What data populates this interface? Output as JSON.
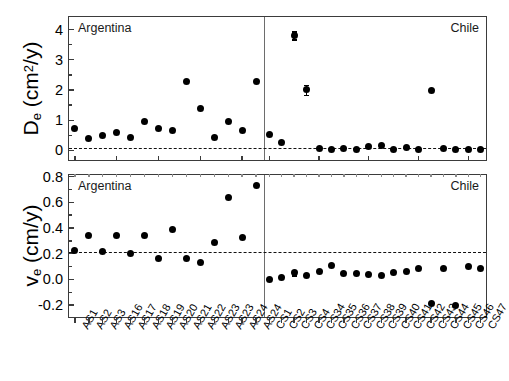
{
  "figure": {
    "panels": [
      {
        "id": "top",
        "ylabel_main": "D",
        "ylabel_sub": "e",
        "ylabel_unit_open": " (cm",
        "ylabel_unit_sup": "2",
        "ylabel_unit_close": "/y)",
        "left_caption": "Argentina",
        "right_caption": "Chile",
        "ytick_labels": [
          "0",
          "1",
          "2",
          "3",
          "4"
        ]
      },
      {
        "id": "bottom",
        "ylabel_main": "v",
        "ylabel_sub": "e",
        "ylabel_unit_open": " (cm",
        "ylabel_unit_sup": "",
        "ylabel_unit_close": "/y)",
        "left_caption": "Argentina",
        "right_caption": "Chile",
        "ytick_labels": [
          "-0.2",
          "0.0",
          "0.2",
          "0.4",
          "0.6",
          "0.8"
        ]
      }
    ]
  },
  "chart_data": [
    {
      "type": "scatter",
      "panel": "top",
      "title": "",
      "xlabel": "",
      "ylabel": "D_e (cm^2/y)",
      "ylim": [
        -0.35,
        4.45
      ],
      "yticks": [
        0,
        1,
        2,
        3,
        4
      ],
      "yticks_minor": [
        0.5,
        1.5,
        2.5,
        3.5
      ],
      "grid": false,
      "legend": "none",
      "reference_line": 0.12,
      "groups": [
        {
          "name": "Argentina",
          "categories": [
            "AS1",
            "AS2",
            "AS3",
            "AS16",
            "AS17",
            "AS18",
            "AS19",
            "AS20",
            "AS21",
            "AS22",
            "AS23",
            "AS23",
            "AS24",
            "AS24"
          ],
          "values": [
            0.72,
            0.38,
            0.48,
            0.6,
            0.42,
            0.96,
            0.73,
            0.67,
            2.27,
            1.38,
            0.42,
            0.96,
            0.67,
            2.27
          ],
          "errors": [
            0,
            0,
            0,
            0,
            0,
            0,
            0,
            0,
            0,
            0,
            0,
            0,
            0,
            0
          ]
        },
        {
          "name": "Chile",
          "categories": [
            "CS1",
            "CS2",
            "CS3",
            "CS4",
            "CS34",
            "CS35",
            "CS36",
            "CS37",
            "CS38",
            "CS39",
            "CS40",
            "CS41",
            "CS42",
            "CS43",
            "CS44",
            "CS45",
            "CS46",
            "CS47"
          ],
          "values": [
            0.53,
            0.25,
            3.81,
            2.01,
            0.05,
            0.03,
            0.06,
            0.04,
            0.13,
            0.16,
            0.04,
            0.1,
            0.04,
            1.98,
            0.05,
            0.03,
            0.04,
            0.03
          ],
          "errors": [
            0,
            0,
            0.13,
            0.16,
            0,
            0,
            0,
            0,
            0,
            0,
            0,
            0,
            0,
            0,
            0,
            0,
            0,
            0
          ]
        }
      ]
    },
    {
      "type": "scatter",
      "panel": "bottom",
      "title": "",
      "xlabel": "",
      "ylabel": "v_e (cm/y)",
      "ylim": [
        -0.3,
        0.82
      ],
      "yticks": [
        -0.2,
        0.0,
        0.2,
        0.4,
        0.6,
        0.8
      ],
      "yticks_minor": [
        -0.1,
        0.1,
        0.3,
        0.5,
        0.7
      ],
      "grid": false,
      "legend": "none",
      "reference_line": 0.219,
      "groups": [
        {
          "name": "Argentina",
          "categories": [
            "AS1",
            "AS2",
            "AS3",
            "AS16",
            "AS17",
            "AS18",
            "AS19",
            "AS20",
            "AS21",
            "AS22",
            "AS23",
            "AS23",
            "AS24",
            "AS24"
          ],
          "values": [
            0.222,
            0.34,
            0.216,
            0.34,
            0.202,
            0.34,
            0.16,
            0.39,
            0.16,
            0.132,
            0.288,
            0.64,
            0.33,
            0.733
          ],
          "errors": [
            0,
            0,
            0,
            0,
            0,
            0,
            0,
            0,
            0,
            0,
            0,
            0,
            0,
            0
          ]
        },
        {
          "name": "Chile",
          "categories": [
            "CS1",
            "CS2",
            "CS3",
            "CS4",
            "CS34",
            "CS35",
            "CS36",
            "CS37",
            "CS38",
            "CS39",
            "CS40",
            "CS41",
            "CS42",
            "CS43",
            "CS44",
            "CS45",
            "CS46",
            "CS47"
          ],
          "values": [
            0.002,
            0.012,
            0.055,
            0.034,
            0.06,
            0.11,
            0.048,
            0.044,
            0.038,
            0.034,
            0.054,
            0.06,
            0.086,
            -0.185,
            0.085,
            -0.2,
            0.1,
            0.085
          ],
          "errors": [
            0,
            0,
            0.022,
            0,
            0,
            0,
            0,
            0,
            0,
            0,
            0,
            0,
            0,
            0,
            0,
            0,
            0,
            0
          ]
        }
      ]
    }
  ],
  "xaxis": {
    "labels": [
      "AS1",
      "AS2",
      "AS3",
      "AS16",
      "AS17",
      "AS18",
      "AS19",
      "AS20",
      "AS21",
      "AS22",
      "AS23",
      "AS23",
      "AS24",
      "AS24",
      "CS1",
      "CS2",
      "CS3",
      "CS4",
      "CS34",
      "CS35",
      "CS36",
      "CS37",
      "CS38",
      "CS39",
      "CS40",
      "CS41",
      "CS42",
      "CS43",
      "CS44",
      "CS45",
      "CS46",
      "CS47"
    ]
  }
}
